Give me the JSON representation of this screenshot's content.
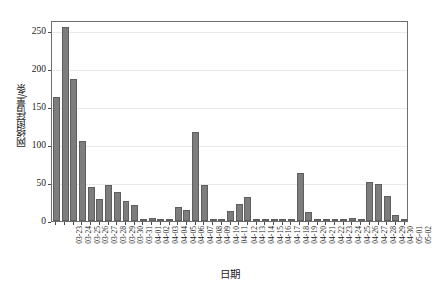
{
  "chart_data": {
    "type": "bar",
    "title": "",
    "xlabel": "日期",
    "ylabel": "网络舆情量/条",
    "ylim": [
      0,
      265
    ],
    "yticks": [
      0,
      50,
      100,
      150,
      200,
      250
    ],
    "ytick_labels": [
      "0",
      "50",
      "100",
      "150",
      "200",
      "250"
    ],
    "grid": true,
    "legend": null,
    "bar_color": "#7d7d7d",
    "bar_edge_color": "#5e5e5e",
    "categories": [
      "03-23",
      "03-24",
      "03-25",
      "03-26",
      "03-27",
      "03-28",
      "03-29",
      "03-30",
      "03-31",
      "04-01",
      "04-02",
      "04-03",
      "04-04",
      "04-05",
      "04-06",
      "04-07",
      "04-08",
      "04-09",
      "04-10",
      "04-11",
      "04-12",
      "04-13",
      "04-14",
      "04-15",
      "04-16",
      "04-17",
      "04-18",
      "04-19",
      "04-20",
      "04-21",
      "04-22",
      "04-23",
      "04-24",
      "04-25",
      "04-26",
      "04-27",
      "04-28",
      "04-29",
      "04-30",
      "05-01",
      "05-02"
    ],
    "values": [
      163,
      256,
      187,
      105,
      45,
      29,
      48,
      38,
      26,
      21,
      1,
      4,
      2,
      1,
      18,
      14,
      118,
      48,
      2,
      3,
      13,
      23,
      32,
      2,
      2,
      2,
      1,
      0,
      63,
      12,
      2,
      1,
      0,
      0,
      4,
      2,
      52,
      49,
      33,
      8,
      1
    ]
  },
  "axes": {
    "ylabel_text": "网络舆情量/条",
    "xlabel_text": "日期"
  }
}
